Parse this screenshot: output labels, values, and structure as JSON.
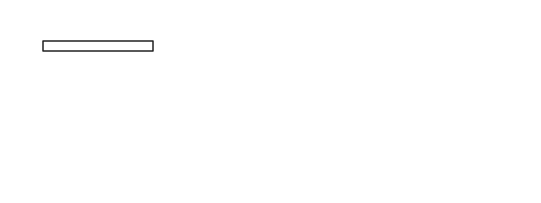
{
  "diagram": {
    "title": "",
    "labels": {
      "neutral_axis": "中和轴",
      "bm1_left": "b",
      "bm1_left_sub": "m1",
      "bt_left": "b",
      "bt_left_sub": "t",
      "bm2_left": "b",
      "bm2_left_sub": "m2",
      "bm2_right": "b",
      "bm2_right_sub": "m2",
      "bt_right": "b",
      "bt_right_sub": "t",
      "bm1_right": "b",
      "bm1_right_sub": "m1",
      "d_left": "d",
      "d_right": "d",
      "hf": "h",
      "hf_sub": "f",
      "hs": "h",
      "hs_sub": "s",
      "gamma": "γ",
      "D_bottom": "D",
      "force_top": "f",
      "force_top_sub": "sd",
      "force_top_A": "A",
      "force_top_A_sup": "s'",
      "force_axis": "f",
      "force_axis_sub": "sd",
      "force_axis_A": "A",
      "force_axis_A_sub": "s",
      "moment": "M",
      "moment_sub": "u",
      "fsc": "f",
      "fsc_sub": "sc",
      "fsc_A": "A",
      "fsc_A_sub": "sc-c",
      "ft": "f",
      "ft_sub": "t",
      "ft_A": "A",
      "ft_A_sub": "sc-t",
      "kfy": "k",
      "kfy_sub1": "t",
      "kfy_f": "f",
      "kfy_sub2": "y",
      "kfy_A": "A",
      "kfy_sub3": "s",
      "xn": "x",
      "xn_sub": "n",
      "ecu": "ε",
      "ecu_sub": "cu",
      "ey": ">ε",
      "ey_sub": "y",
      "hb": "h",
      "hb_sub": "b",
      "h0": "h",
      "h0_sub": "0",
      "D_right": "D"
    },
    "colors": {
      "line": "#1a1a1a",
      "axis": "#555555"
    }
  }
}
